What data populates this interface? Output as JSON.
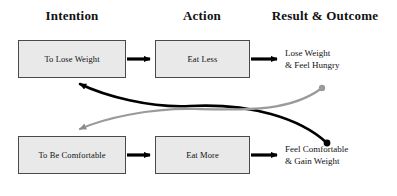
{
  "diagram": {
    "columns": [
      {
        "label": "Intention",
        "cx": 72
      },
      {
        "label": "Action",
        "cx": 202
      },
      {
        "label": "Result & Outcome",
        "cx": 325
      }
    ],
    "nodes": [
      {
        "id": "to-lose-weight",
        "label": "To Lose Weight",
        "x": 18,
        "y": 40,
        "w": 108,
        "h": 38
      },
      {
        "id": "eat-less",
        "label": "Eat Less",
        "x": 155,
        "y": 40,
        "w": 95,
        "h": 38
      },
      {
        "id": "to-be-comfortable",
        "label": "To Be Comfortable",
        "x": 18,
        "y": 136,
        "w": 108,
        "h": 38
      },
      {
        "id": "eat-more",
        "label": "Eat More",
        "x": 155,
        "y": 136,
        "w": 95,
        "h": 38
      }
    ],
    "outcomes": [
      {
        "id": "lose-weight-feel-hungry",
        "line1": "Lose Weight",
        "line2": "& Feel Hungry",
        "x": 285,
        "y": 48
      },
      {
        "id": "feel-comfortable-gain-weight",
        "line1": "Feel Comfortable",
        "line2": "& Gain Weight",
        "x": 285,
        "y": 144
      }
    ],
    "colors": {
      "box_fill": "#e9e9e9",
      "box_border": "#4a4a4a",
      "arrow_dark": "#000000",
      "arrow_gray": "#8c8c8c",
      "text": "#111111",
      "background": "#ffffff"
    },
    "connectors": [
      {
        "id": "lose-weight-to-eat-less",
        "from": "to-lose-weight",
        "to": "eat-less",
        "style": "straight",
        "color": "dark"
      },
      {
        "id": "eat-less-to-outcome",
        "from": "eat-less",
        "to": "lose-weight-feel-hungry",
        "style": "straight",
        "color": "dark"
      },
      {
        "id": "be-comfortable-to-eat-more",
        "from": "to-be-comfortable",
        "to": "eat-more",
        "style": "straight",
        "color": "dark"
      },
      {
        "id": "eat-more-to-outcome",
        "from": "eat-more",
        "to": "feel-comfortable-gain-weight",
        "style": "straight",
        "color": "dark"
      },
      {
        "id": "gain-weight-feedback-to-lose-weight",
        "from": "feel-comfortable-gain-weight",
        "to": "to-lose-weight",
        "style": "curved",
        "color": "dark"
      },
      {
        "id": "feel-hungry-feedback-to-be-comfortable",
        "from": "lose-weight-feel-hungry",
        "to": "to-be-comfortable",
        "style": "curved",
        "color": "gray"
      }
    ]
  }
}
